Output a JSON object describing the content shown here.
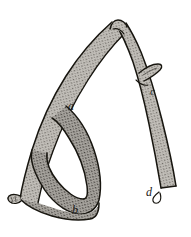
{
  "figure": {
    "kind": "botanical-line-engraving",
    "background_color": "#ffffff",
    "ink_color": "#1a1a1a",
    "fill_tone_color": "#b9b6b0",
    "stipple_color": "#5a5651",
    "width": 191,
    "height": 237
  },
  "labels": [
    {
      "id": "a",
      "text": "a",
      "x": 68,
      "y": 110,
      "note": "upper junction of loop branch"
    },
    {
      "id": "b",
      "text": "b",
      "x": 72,
      "y": 214,
      "note": "lower junction of loop branch"
    },
    {
      "id": "c",
      "text": "c",
      "x": 150,
      "y": 95,
      "note": "lateral bud on right branch"
    },
    {
      "id": "d",
      "text": "d",
      "x": 146,
      "y": 196,
      "note": "base of right branch"
    }
  ],
  "parts": [
    {
      "name": "left-branch",
      "description": "long curving limb rising from lower left to apex"
    },
    {
      "name": "right-branch",
      "description": "straighter limb descending from apex to lower right"
    },
    {
      "name": "loop-branch",
      "description": "closed oval loop between a and b"
    },
    {
      "name": "apex",
      "description": "sharp fork where both limbs meet at top"
    },
    {
      "name": "lateral-bud",
      "description": "small pointed outgrowth at c"
    },
    {
      "name": "basal-stub",
      "description": "short cut stub at lower left"
    },
    {
      "name": "basal-stub-right",
      "description": "short cut stub at d"
    }
  ]
}
